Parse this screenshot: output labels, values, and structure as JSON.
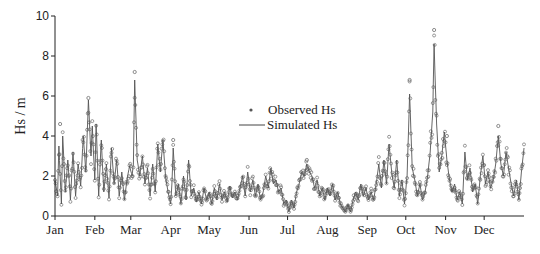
{
  "chart_data": {
    "type": "line",
    "title": "",
    "xlabel": "",
    "ylabel": "Hs / m",
    "ylim": [
      0,
      10
    ],
    "yticks": [
      "0",
      "2",
      "4",
      "6",
      "8",
      "10"
    ],
    "ytick_values": [
      0,
      2,
      4,
      6,
      8,
      10
    ],
    "xlim_days": [
      0,
      365
    ],
    "month_labels": [
      "Jan",
      "Feb",
      "Mar",
      "Apr",
      "May",
      "Jun",
      "Jul",
      "Aug",
      "Sep",
      "Oct",
      "Nov",
      "Dec"
    ],
    "month_start_days": [
      0,
      31,
      59,
      90,
      120,
      151,
      181,
      212,
      243,
      273,
      304,
      334
    ],
    "grid": false,
    "legend": {
      "position": "center",
      "entries": [
        {
          "label": "Observed Hs",
          "marker": "circle"
        },
        {
          "label": "Simulated Hs",
          "marker": "line"
        }
      ]
    },
    "series_colors": {
      "observed": "#707070",
      "simulated": "#555555"
    },
    "series": [
      {
        "name": "Simulated Hs",
        "note": "approximate envelope keyframes (day, Hs m) read from figure",
        "points": [
          [
            0,
            1.8
          ],
          [
            2,
            1.0
          ],
          [
            3,
            3.5
          ],
          [
            5,
            0.6
          ],
          [
            6,
            4.0
          ],
          [
            8,
            1.2
          ],
          [
            10,
            2.8
          ],
          [
            12,
            0.8
          ],
          [
            14,
            3.2
          ],
          [
            16,
            1.0
          ],
          [
            18,
            2.6
          ],
          [
            20,
            1.5
          ],
          [
            22,
            4.0
          ],
          [
            24,
            2.2
          ],
          [
            26,
            5.8
          ],
          [
            28,
            3.0
          ],
          [
            29,
            4.5
          ],
          [
            31,
            1.8
          ],
          [
            32,
            4.6
          ],
          [
            34,
            1.0
          ],
          [
            36,
            3.8
          ],
          [
            38,
            1.2
          ],
          [
            40,
            2.6
          ],
          [
            42,
            0.9
          ],
          [
            44,
            3.4
          ],
          [
            46,
            1.6
          ],
          [
            48,
            2.8
          ],
          [
            50,
            1.0
          ],
          [
            52,
            2.2
          ],
          [
            54,
            0.8
          ],
          [
            56,
            1.8
          ],
          [
            58,
            2.5
          ],
          [
            60,
            2.0
          ],
          [
            61,
            2.6
          ],
          [
            62,
            6.8
          ],
          [
            64,
            2.8
          ],
          [
            66,
            2.0
          ],
          [
            68,
            3.0
          ],
          [
            70,
            1.6
          ],
          [
            72,
            2.4
          ],
          [
            74,
            1.0
          ],
          [
            76,
            2.6
          ],
          [
            78,
            1.2
          ],
          [
            80,
            3.6
          ],
          [
            82,
            2.2
          ],
          [
            84,
            3.8
          ],
          [
            86,
            2.0
          ],
          [
            88,
            1.2
          ],
          [
            90,
            0.6
          ],
          [
            91,
            1.6
          ],
          [
            92,
            3.4
          ],
          [
            94,
            1.0
          ],
          [
            96,
            1.6
          ],
          [
            98,
            0.6
          ],
          [
            100,
            2.0
          ],
          [
            102,
            0.8
          ],
          [
            104,
            2.8
          ],
          [
            106,
            1.0
          ],
          [
            108,
            1.4
          ],
          [
            110,
            0.7
          ],
          [
            112,
            1.2
          ],
          [
            114,
            0.6
          ],
          [
            116,
            1.4
          ],
          [
            118,
            0.8
          ],
          [
            120,
            1.2
          ],
          [
            122,
            0.6
          ],
          [
            124,
            1.4
          ],
          [
            126,
            0.8
          ],
          [
            128,
            1.6
          ],
          [
            130,
            0.8
          ],
          [
            132,
            1.2
          ],
          [
            134,
            0.7
          ],
          [
            136,
            1.5
          ],
          [
            138,
            0.9
          ],
          [
            140,
            1.2
          ],
          [
            142,
            0.8
          ],
          [
            144,
            1.4
          ],
          [
            146,
            2.0
          ],
          [
            148,
            1.0
          ],
          [
            150,
            2.2
          ],
          [
            152,
            1.2
          ],
          [
            154,
            1.8
          ],
          [
            156,
            1.0
          ],
          [
            158,
            1.6
          ],
          [
            160,
            0.8
          ],
          [
            162,
            1.2
          ],
          [
            164,
            2.0
          ],
          [
            166,
            1.4
          ],
          [
            168,
            2.4
          ],
          [
            170,
            1.6
          ],
          [
            172,
            1.8
          ],
          [
            174,
            1.2
          ],
          [
            176,
            1.4
          ],
          [
            178,
            0.6
          ],
          [
            180,
            0.8
          ],
          [
            182,
            0.2
          ],
          [
            184,
            0.8
          ],
          [
            186,
            0.4
          ],
          [
            188,
            1.2
          ],
          [
            190,
            1.6
          ],
          [
            192,
            2.2
          ],
          [
            194,
            2.0
          ],
          [
            196,
            2.6
          ],
          [
            198,
            2.2
          ],
          [
            200,
            2.0
          ],
          [
            202,
            1.4
          ],
          [
            204,
            1.8
          ],
          [
            206,
            1.0
          ],
          [
            208,
            1.4
          ],
          [
            210,
            0.8
          ],
          [
            212,
            1.4
          ],
          [
            214,
            1.0
          ],
          [
            216,
            1.6
          ],
          [
            218,
            0.8
          ],
          [
            220,
            1.2
          ],
          [
            222,
            0.6
          ],
          [
            224,
            0.4
          ],
          [
            226,
            0.2
          ],
          [
            228,
            0.6
          ],
          [
            230,
            0.2
          ],
          [
            232,
            0.8
          ],
          [
            234,
            1.2
          ],
          [
            236,
            0.8
          ],
          [
            238,
            1.6
          ],
          [
            240,
            1.0
          ],
          [
            242,
            1.4
          ],
          [
            244,
            0.8
          ],
          [
            246,
            1.2
          ],
          [
            248,
            0.8
          ],
          [
            250,
            1.6
          ],
          [
            252,
            2.6
          ],
          [
            254,
            1.4
          ],
          [
            256,
            2.8
          ],
          [
            258,
            1.6
          ],
          [
            260,
            3.6
          ],
          [
            262,
            2.2
          ],
          [
            264,
            1.4
          ],
          [
            266,
            2.8
          ],
          [
            268,
            1.0
          ],
          [
            270,
            1.8
          ],
          [
            272,
            0.6
          ],
          [
            274,
            2.0
          ],
          [
            276,
            6.1
          ],
          [
            278,
            2.4
          ],
          [
            280,
            1.8
          ],
          [
            282,
            1.0
          ],
          [
            284,
            1.6
          ],
          [
            286,
            0.8
          ],
          [
            288,
            1.2
          ],
          [
            290,
            2.0
          ],
          [
            292,
            3.2
          ],
          [
            294,
            5.2
          ],
          [
            295,
            8.6
          ],
          [
            297,
            4.6
          ],
          [
            299,
            2.2
          ],
          [
            301,
            3.0
          ],
          [
            303,
            4.2
          ],
          [
            305,
            2.8
          ],
          [
            307,
            1.8
          ],
          [
            309,
            1.2
          ],
          [
            311,
            1.6
          ],
          [
            313,
            0.8
          ],
          [
            315,
            1.2
          ],
          [
            317,
            0.6
          ],
          [
            319,
            3.2
          ],
          [
            321,
            1.8
          ],
          [
            323,
            2.4
          ],
          [
            325,
            1.2
          ],
          [
            327,
            1.6
          ],
          [
            329,
            0.6
          ],
          [
            331,
            2.0
          ],
          [
            333,
            3.0
          ],
          [
            335,
            1.6
          ],
          [
            337,
            2.2
          ],
          [
            339,
            1.4
          ],
          [
            341,
            1.8
          ],
          [
            343,
            2.6
          ],
          [
            345,
            4.0
          ],
          [
            347,
            2.6
          ],
          [
            349,
            2.0
          ],
          [
            351,
            3.2
          ],
          [
            353,
            2.4
          ],
          [
            355,
            1.6
          ],
          [
            357,
            1.0
          ],
          [
            359,
            1.8
          ],
          [
            361,
            0.8
          ],
          [
            363,
            2.2
          ],
          [
            365,
            3.4
          ]
        ]
      },
      {
        "name": "Observed Hs",
        "note": "notable observed peaks (day, Hs m) read from figure",
        "peaks": [
          [
            4,
            4.6
          ],
          [
            26,
            5.9
          ],
          [
            62,
            7.2
          ],
          [
            92,
            3.8
          ],
          [
            196,
            2.8
          ],
          [
            276,
            6.8
          ],
          [
            295,
            9.3
          ],
          [
            305,
            4.0
          ],
          [
            345,
            4.5
          ]
        ]
      }
    ]
  }
}
